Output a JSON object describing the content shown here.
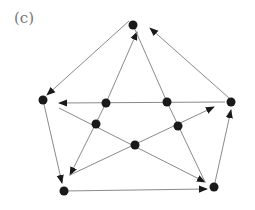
{
  "figure": {
    "label": "(c)",
    "edge_color": "#8a8a8a",
    "node_color": "#1a1a1a",
    "arrow_color": "#1a1a1a"
  },
  "nodes": [
    {
      "id": "outer-top",
      "x": 133,
      "y": 25
    },
    {
      "id": "outer-left",
      "x": 43,
      "y": 100
    },
    {
      "id": "outer-right",
      "x": 231,
      "y": 102
    },
    {
      "id": "outer-bottom-left",
      "x": 64,
      "y": 191
    },
    {
      "id": "outer-bottom-right",
      "x": 214,
      "y": 187
    },
    {
      "id": "inner-upper-left",
      "x": 106,
      "y": 103
    },
    {
      "id": "inner-upper-right",
      "x": 167,
      "y": 102
    },
    {
      "id": "inner-mid-left",
      "x": 96,
      "y": 124
    },
    {
      "id": "inner-mid-right",
      "x": 178,
      "y": 126
    },
    {
      "id": "inner-bottom",
      "x": 135,
      "y": 145
    }
  ],
  "edges": [
    {
      "from": [
        129,
        21
      ],
      "to": [
        47,
        95
      ],
      "arrow": [
        49,
        93
      ]
    },
    {
      "from": [
        229,
        98
      ],
      "to": [
        150,
        28
      ],
      "arrow": [
        150,
        28
      ]
    },
    {
      "from": [
        106,
        103
      ],
      "to": [
        137,
        32
      ],
      "arrow": [
        137,
        34
      ]
    },
    {
      "from": [
        133,
        25
      ],
      "to": [
        167,
        102
      ],
      "arrow": null
    },
    {
      "from": [
        225,
        102
      ],
      "to": [
        59,
        103
      ],
      "arrow": [
        59,
        103
      ]
    },
    {
      "from": [
        43,
        100
      ],
      "to": [
        62,
        183
      ],
      "arrow": [
        61,
        181
      ]
    },
    {
      "from": [
        64,
        191
      ],
      "to": [
        207,
        189
      ],
      "arrow": [
        207,
        189
      ]
    },
    {
      "from": [
        214,
        187
      ],
      "to": [
        231,
        110
      ],
      "arrow": [
        231,
        110
      ]
    },
    {
      "from": [
        106,
        103
      ],
      "to": [
        70,
        175
      ],
      "arrow": [
        71,
        173
      ]
    },
    {
      "from": [
        59,
        108
      ],
      "to": [
        205,
        182
      ],
      "arrow": [
        203,
        181
      ]
    },
    {
      "from": [
        167,
        102
      ],
      "to": [
        205,
        182
      ],
      "arrow": null
    },
    {
      "from": [
        70,
        175
      ],
      "to": [
        214,
        107
      ],
      "arrow": [
        214,
        107
      ]
    }
  ]
}
